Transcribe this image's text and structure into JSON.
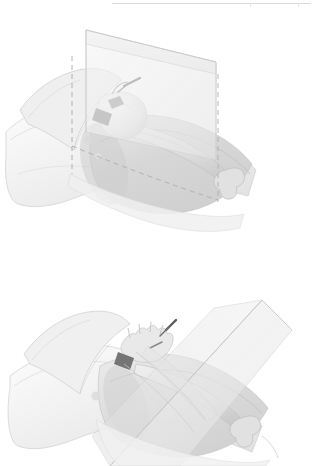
{
  "page": {
    "background_color": "#ffffff",
    "width": 312,
    "height": 466,
    "content_type": "anatomical-illustration-plate",
    "rule": {
      "name": "top-horizontal-rule",
      "color": "#d9d9d9",
      "visible": true
    }
  },
  "palette": {
    "background": "#ffffff",
    "plane_fill": "#f1f1f1",
    "plane_fill_dark": "#e6e6e6",
    "plane_edge": "#d2d2d2",
    "skin_light": "#f4f4f4",
    "skin_mid": "#e8e8e8",
    "skin_shadow": "#d8d8d8",
    "bone_light": "#ededed",
    "bone_mid": "#dcdcdc",
    "bone_shadow": "#c8c8c8",
    "muscle_mid": "#d9d9d9",
    "muscle_dark": "#c9c9c9",
    "instrument_dark": "#6b6b6b",
    "instrument_darkest": "#4f4f4f",
    "outline": "#bdbdbd",
    "dashed_line": "#a8a8a8"
  },
  "figures": [
    {
      "id": "figure-top",
      "name": "hip-joint-with-vertical-section-plane",
      "description": "Grayscale anatomical illustration of a pelvis and proximal femur viewed obliquely, intersected by a translucent planar section. Dashed reference lines mark the plane trace on the body surface.",
      "elements": [
        {
          "name": "section-plane",
          "label": "translucent sectioning plane",
          "orientation": "oblique-sagittal"
        },
        {
          "name": "pelvis",
          "label": "pelvis / ilium"
        },
        {
          "name": "femur",
          "label": "femur with distal condyles"
        },
        {
          "name": "femoral-head",
          "label": "femoral head in acetabulum"
        },
        {
          "name": "thigh-soft-tissue",
          "label": "thigh soft tissue envelope"
        },
        {
          "name": "surgical-instrument",
          "label": "dark instrument at joint"
        },
        {
          "name": "dashed-plane-trace-vertical",
          "label": "vertical dashed trace"
        },
        {
          "name": "dashed-plane-trace-oblique",
          "label": "oblique dashed trace"
        }
      ]
    },
    {
      "id": "figure-bottom",
      "name": "hip-joint-with-angled-section-plane",
      "description": "Companion grayscale illustration of the same hip and femur with the sectioning plane rotated to an angled, folded orientation crossing the thigh.",
      "elements": [
        {
          "name": "section-plane",
          "label": "translucent sectioning plane",
          "orientation": "angled-folded"
        },
        {
          "name": "pelvis",
          "label": "pelvis / ilium"
        },
        {
          "name": "femur",
          "label": "femur with distal condyles"
        },
        {
          "name": "thigh-soft-tissue",
          "label": "thigh soft tissue envelope"
        },
        {
          "name": "retractor-hand",
          "label": "retractor / hand-like structure at joint"
        },
        {
          "name": "surgical-instrument",
          "label": "dark instrument at joint"
        },
        {
          "name": "plane-band",
          "label": "plane band crossing thigh"
        }
      ]
    }
  ]
}
